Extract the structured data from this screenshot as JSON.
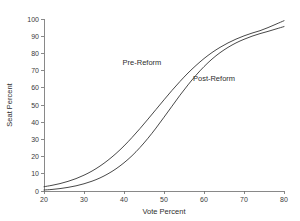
{
  "chart_data": {
    "type": "line",
    "title": "",
    "xlabel": "Vote Percent",
    "ylabel": "Seat Percent",
    "xlim": [
      20,
      80
    ],
    "ylim": [
      0,
      100
    ],
    "xticks": [
      20,
      30,
      40,
      50,
      60,
      70,
      80
    ],
    "yticks": [
      0,
      10,
      20,
      30,
      40,
      50,
      60,
      70,
      80,
      90,
      100
    ],
    "grid": false,
    "legend": "inline-annotations",
    "line_color": "#333333",
    "background_color": "#ffffff",
    "x": [
      20,
      22,
      24,
      26,
      28,
      30,
      32,
      34,
      36,
      38,
      40,
      42,
      44,
      46,
      48,
      50,
      52,
      54,
      56,
      58,
      60,
      62,
      64,
      66,
      68,
      70,
      72,
      74,
      76,
      78,
      80
    ],
    "series": [
      {
        "name": "Pre-Reform",
        "label": "Pre-Reform",
        "values": [
          2.5,
          3.3,
          4.3,
          5.6,
          7.2,
          9.2,
          11.6,
          14.5,
          17.9,
          21.8,
          26.2,
          31.1,
          36.3,
          41.8,
          47.4,
          53.0,
          58.5,
          63.7,
          68.6,
          73.0,
          77.0,
          80.5,
          83.5,
          86.1,
          88.3,
          90.2,
          91.8,
          93.2,
          95.0,
          97.0,
          99.0
        ]
      },
      {
        "name": "Post-Reform",
        "label": "Post-Reform",
        "values": [
          0.6,
          0.9,
          1.4,
          2.1,
          3.0,
          4.2,
          5.7,
          7.6,
          10.0,
          12.9,
          16.4,
          20.5,
          25.3,
          30.7,
          36.6,
          42.9,
          49.3,
          55.7,
          61.7,
          67.3,
          72.3,
          76.7,
          80.4,
          83.5,
          86.1,
          88.2,
          90.0,
          91.5,
          92.8,
          94.2,
          95.6
        ]
      }
    ],
    "annotations": [
      {
        "text": "Pre-Reform",
        "x_data": 44.5,
        "y_data": 73.0
      },
      {
        "text": "Post-Reform",
        "x_data": 62.5,
        "y_data": 64.0
      }
    ],
    "crossing_point": {
      "x": 53,
      "y": 52
    }
  }
}
